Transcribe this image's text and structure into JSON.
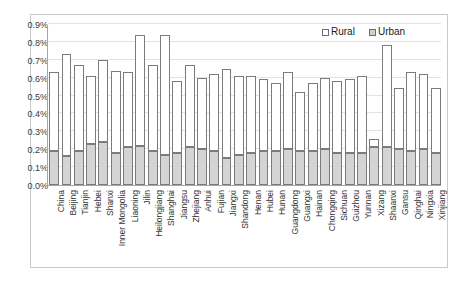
{
  "legend": {
    "position": "top-right",
    "entries": [
      {
        "label": "Rural",
        "color": "#ffffff",
        "swatch": "rural"
      },
      {
        "label": "Urban",
        "color": "#d4d4d4",
        "swatch": "urban"
      }
    ]
  },
  "axis": {
    "y_ticks": [
      "0.0%",
      "0.1%",
      "0.2%",
      "0.3%",
      "0.4%",
      "0.5%",
      "0.6%",
      "0.7%",
      "0.8%",
      "0.9%"
    ]
  },
  "chart_data": {
    "type": "bar",
    "subtype": "stacked",
    "title": "",
    "xlabel": "",
    "ylabel": "",
    "ylim": [
      0,
      0.9
    ],
    "yunit": "%",
    "grid": true,
    "legend_position": "top-right",
    "categories": [
      "China",
      "Beijing",
      "Tianjin",
      "Hebei",
      "Shanxi",
      "Inner Mongolia",
      "Liaoning",
      "Jilin",
      "Heilongjiang",
      "Shanghai",
      "Jiangsu",
      "Zhejiang",
      "Anhui",
      "Fujian",
      "Jiangxi",
      "Shandong",
      "Henan",
      "Hubei",
      "Hunan",
      "Guangdong",
      "Guangxi",
      "Hainan",
      "Chongqing",
      "Sichuan",
      "Guizhou",
      "Yunnan",
      "Xizang",
      "Shaanxi",
      "Gansu",
      "Qinghai",
      "Ningxia",
      "Xinjiang"
    ],
    "series": [
      {
        "name": "Urban",
        "color": "#d4d4d4",
        "values": [
          0.19,
          0.16,
          0.19,
          0.23,
          0.24,
          0.18,
          0.21,
          0.22,
          0.19,
          0.17,
          0.18,
          0.21,
          0.2,
          0.19,
          0.15,
          0.17,
          0.18,
          0.19,
          0.19,
          0.2,
          0.19,
          0.19,
          0.2,
          0.18,
          0.18,
          0.18,
          0.21,
          0.21,
          0.2,
          0.19,
          0.2,
          0.18
        ]
      },
      {
        "name": "Rural",
        "color": "#ffffff",
        "values": [
          0.44,
          0.57,
          0.48,
          0.38,
          0.46,
          0.46,
          0.42,
          0.62,
          0.48,
          0.67,
          0.4,
          0.46,
          0.4,
          0.43,
          0.5,
          0.44,
          0.43,
          0.4,
          0.38,
          0.43,
          0.33,
          0.38,
          0.4,
          0.4,
          0.41,
          0.43,
          0.05,
          0.57,
          0.34,
          0.44,
          0.42,
          0.36
        ]
      }
    ],
    "totals": [
      0.63,
      0.73,
      0.67,
      0.61,
      0.7,
      0.64,
      0.63,
      0.84,
      0.67,
      0.84,
      0.58,
      0.67,
      0.6,
      0.62,
      0.65,
      0.61,
      0.61,
      0.59,
      0.57,
      0.63,
      0.52,
      0.57,
      0.6,
      0.58,
      0.59,
      0.61,
      0.26,
      0.78,
      0.54,
      0.63,
      0.62,
      0.54
    ]
  }
}
